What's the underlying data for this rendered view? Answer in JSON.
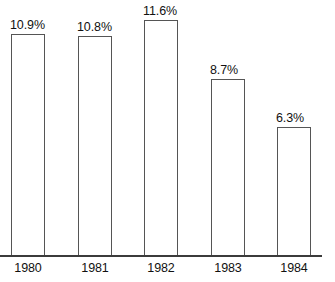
{
  "chart_data": {
    "type": "bar",
    "title": "",
    "subtitle": "",
    "xlabel": "",
    "ylabel": "",
    "categories": [
      "1980",
      "1981",
      "1982",
      "1983",
      "1984"
    ],
    "values": [
      10.9,
      10.8,
      11.6,
      8.7,
      6.3
    ],
    "value_labels": [
      "10.9%",
      "10.8%",
      "11.6%",
      "8.7%",
      "6.3%"
    ],
    "unit": "%",
    "ylim": [
      0,
      12.6
    ],
    "grid": false,
    "legend": null,
    "legend_position": "none",
    "annotations": [],
    "series": [
      {
        "name": "",
        "values": [
          10.9,
          10.8,
          11.6,
          8.7,
          6.3
        ]
      }
    ]
  },
  "style": {
    "background_color": "#ffffff",
    "bar_fill_color": "#ffffff",
    "bar_border_color": "#555555",
    "axis_color": "#3b3b3b",
    "text_color": "#111111"
  },
  "geometry": {
    "baseline_y": 255,
    "axis_width": 322,
    "bar_width": 34,
    "bar_pitch": 66.5,
    "first_bar_left": 11,
    "bar_tops": [
      34,
      40,
      21,
      83,
      156
    ]
  }
}
